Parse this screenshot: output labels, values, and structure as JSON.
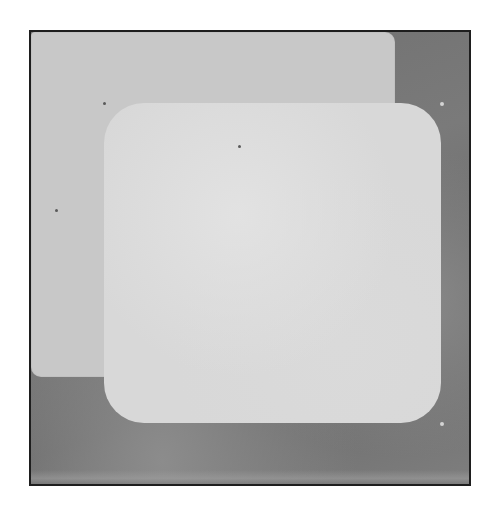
{
  "scene": {
    "description": "Two overlapping light-gray rounded rectangle panels on a dark gray framed background",
    "colors": {
      "frame_border": "#1e1e1e",
      "background": "#727272",
      "back_panel": "#c8c8c8",
      "front_panel": "#d8d8d8"
    },
    "panels": [
      {
        "name": "back-panel",
        "corner": "small"
      },
      {
        "name": "front-panel",
        "corner": "large"
      }
    ]
  }
}
